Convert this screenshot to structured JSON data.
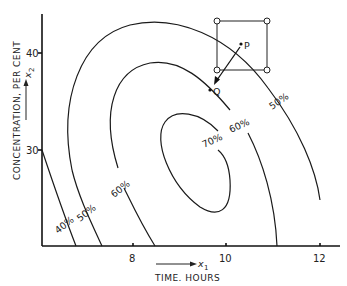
{
  "figure": {
    "x_axis": {
      "label": "TIME.  HOURS",
      "variable": "x",
      "variable_sub": "1",
      "ticks": [
        "8",
        "10",
        "12"
      ]
    },
    "y_axis": {
      "label": "CONCENTRATION,  PER CENT",
      "variable": "x",
      "variable_sub": "2",
      "ticks": [
        "30",
        "40"
      ]
    },
    "contours": [
      {
        "label": "40%"
      },
      {
        "label": "50%"
      },
      {
        "label": "60%"
      },
      {
        "label": "70%"
      },
      {
        "label": "60%"
      },
      {
        "label": "50%"
      }
    ],
    "points": {
      "p": "P",
      "q": "Q"
    },
    "colors": {
      "ink": "#1a1a1a",
      "background": "#ffffff"
    }
  }
}
